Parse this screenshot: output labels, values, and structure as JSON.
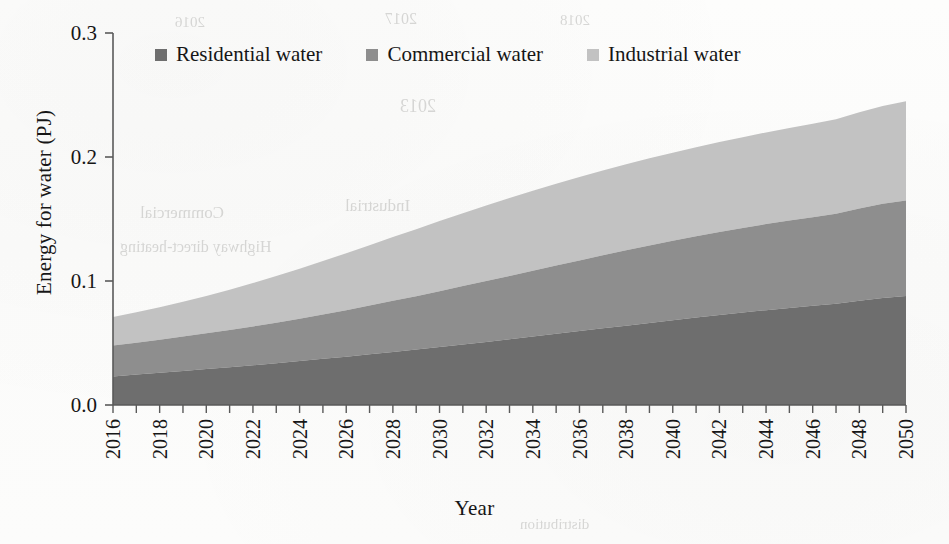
{
  "chart_data": {
    "type": "area",
    "stacked": true,
    "title": "",
    "xlabel": "Year",
    "ylabel": "Energy for water (PJ)",
    "xlim": [
      2016,
      2050
    ],
    "ylim": [
      0.0,
      0.3
    ],
    "yticks": [
      "0.0",
      "0.1",
      "0.2",
      "0.3"
    ],
    "ytick_values": [
      0.0,
      0.1,
      0.2,
      0.3
    ],
    "xtick_labels": [
      "2016",
      "2018",
      "2020",
      "2022",
      "2024",
      "2026",
      "2028",
      "2030",
      "2032",
      "2034",
      "2036",
      "2038",
      "2040",
      "2042",
      "2044",
      "2046",
      "2048",
      "2050"
    ],
    "xtick_minor_every": 1,
    "grid": false,
    "legend_position": "top",
    "x": [
      2016,
      2017,
      2018,
      2019,
      2020,
      2021,
      2022,
      2023,
      2024,
      2025,
      2026,
      2027,
      2028,
      2029,
      2030,
      2031,
      2032,
      2033,
      2034,
      2035,
      2036,
      2037,
      2038,
      2039,
      2040,
      2041,
      2042,
      2043,
      2044,
      2045,
      2046,
      2047,
      2048,
      2049,
      2050
    ],
    "series": [
      {
        "name": "Residential water",
        "color": "#6e6e6e",
        "values": [
          0.023,
          0.0245,
          0.026,
          0.0275,
          0.029,
          0.0305,
          0.032,
          0.0337,
          0.0354,
          0.0372,
          0.039,
          0.0409,
          0.0428,
          0.0447,
          0.0467,
          0.0488,
          0.0509,
          0.053,
          0.0552,
          0.0574,
          0.0596,
          0.0618,
          0.064,
          0.0662,
          0.0684,
          0.0705,
          0.0726,
          0.0746,
          0.0765,
          0.0783,
          0.08,
          0.0816,
          0.0841,
          0.0862,
          0.088
        ]
      },
      {
        "name": "Commercial water",
        "color": "#8e8e8e",
        "values": [
          0.025,
          0.0258,
          0.0267,
          0.0277,
          0.0288,
          0.03,
          0.0313,
          0.0327,
          0.0342,
          0.0358,
          0.0375,
          0.0393,
          0.0412,
          0.0431,
          0.0451,
          0.0471,
          0.0491,
          0.0511,
          0.0531,
          0.0551,
          0.057,
          0.0589,
          0.0607,
          0.0624,
          0.064,
          0.0655,
          0.0669,
          0.0682,
          0.0694,
          0.0705,
          0.0715,
          0.0726,
          0.0744,
          0.0761,
          0.077
        ]
      },
      {
        "name": "Industrial water",
        "color": "#c2c2c2",
        "values": [
          0.023,
          0.0245,
          0.0262,
          0.0281,
          0.0302,
          0.0325,
          0.035,
          0.0376,
          0.0403,
          0.0431,
          0.0459,
          0.0487,
          0.0514,
          0.054,
          0.0565,
          0.0588,
          0.0609,
          0.0628,
          0.0645,
          0.066,
          0.0673,
          0.0684,
          0.0694,
          0.0703,
          0.0711,
          0.0718,
          0.0725,
          0.0732,
          0.0739,
          0.0746,
          0.0754,
          0.0762,
          0.0775,
          0.0788,
          0.08
        ]
      }
    ],
    "totals_endpoints": {
      "2016": 0.071,
      "2050": 0.245
    }
  },
  "legend": {
    "items": [
      {
        "label": "Residential water",
        "color": "#6e6e6e"
      },
      {
        "label": "Commercial water",
        "color": "#8e8e8e"
      },
      {
        "label": "Industrial water",
        "color": "#c2c2c2"
      }
    ]
  },
  "axes": {
    "y_title": "Energy for water (PJ)",
    "x_title": "Year"
  },
  "bleed_through": {
    "ghosts": [
      {
        "text": "2016",
        "x": 175,
        "y": 14,
        "size": 15
      },
      {
        "text": "2017",
        "x": 385,
        "y": 10,
        "size": 16
      },
      {
        "text": "2018",
        "x": 560,
        "y": 12,
        "size": 15
      },
      {
        "text": "2013",
        "x": 400,
        "y": 96,
        "size": 18
      },
      {
        "text": "Industrial",
        "x": 345,
        "y": 196,
        "size": 17
      },
      {
        "text": "Commercial",
        "x": 140,
        "y": 203,
        "size": 17
      },
      {
        "text": "Highway direct-heating",
        "x": 120,
        "y": 238,
        "size": 16
      },
      {
        "text": "distribution",
        "x": 520,
        "y": 516,
        "size": 15
      }
    ]
  }
}
